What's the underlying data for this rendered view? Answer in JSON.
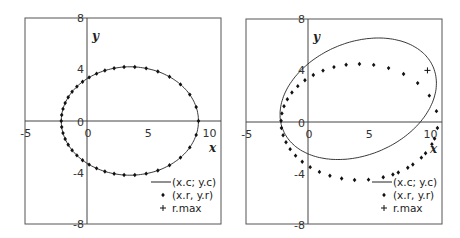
{
  "chart_data": [
    {
      "type": "scatter",
      "title": "",
      "xlabel": "x",
      "ylabel": "y",
      "xlim": [
        -5,
        11
      ],
      "ylim": [
        -8,
        8
      ],
      "xticks": [
        "-5",
        "0",
        "5",
        "10"
      ],
      "yticks": [
        "8",
        "4",
        "0",
        "-4",
        "-8"
      ],
      "grid": false,
      "legend_position": "bottom-right",
      "legend": [
        "(x.c; y.c)",
        "(x.r, y.r)",
        "r.max"
      ],
      "curve": {
        "name": "(x.c; y.c)",
        "center": [
          3.5,
          0
        ],
        "a": 5.6,
        "b": 4.2,
        "rotation_deg": 0
      },
      "points": {
        "name": "(x.r, y.r)",
        "center": [
          3.5,
          0
        ],
        "a": 5.6,
        "b": 4.2,
        "rotation_deg": 0,
        "count": 40,
        "eccentric": 0.8
      },
      "rmax": null,
      "box": {
        "left": 25,
        "top": 18,
        "right": 221,
        "bottom": 224,
        "x0": 87,
        "y0": 121,
        "sx": 12.25,
        "sy": 12.9
      }
    },
    {
      "type": "scatter",
      "title": "",
      "xlabel": "x",
      "ylabel": "y",
      "xlim": [
        -5,
        11
      ],
      "ylim": [
        -8,
        8
      ],
      "xticks": [
        "-5",
        "0",
        "5",
        "10"
      ],
      "yticks": [
        "8",
        "4",
        "0",
        "-4",
        "-8"
      ],
      "grid": false,
      "legend_position": "bottom-right",
      "legend": [
        "(x.c; y.c)",
        "(x.r, y.r)",
        "r.max"
      ],
      "curve": {
        "name": "(x.c; y.c)",
        "center": [
          4.1,
          1.8
        ],
        "a": 6.6,
        "b": 4.4,
        "rotation_deg": 20
      },
      "points": {
        "name": "(x.r, y.r)",
        "center": [
          4.2,
          0
        ],
        "a": 6.4,
        "b": 4.5,
        "rotation_deg": 0,
        "count": 40,
        "eccentric": 0.8,
        "start_deg": -44,
        "end_deg": 360
      },
      "rmax": {
        "name": "r.max",
        "x": 9.75,
        "y": 4.0
      },
      "box": {
        "left": 246,
        "top": 19,
        "right": 442,
        "bottom": 224,
        "x0": 308,
        "y0": 122,
        "sx": 12.25,
        "sy": 12.9
      }
    }
  ]
}
